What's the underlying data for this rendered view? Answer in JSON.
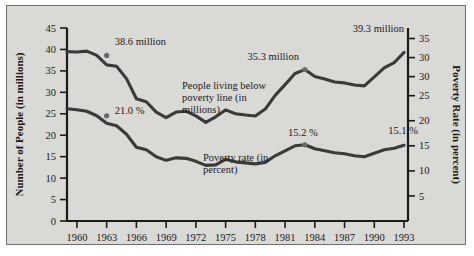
{
  "chart_data": {
    "type": "line",
    "title": "",
    "xlabel": "",
    "ylabel": "Number of People (in millions)",
    "y2label": "Poverty Rate (in percent)",
    "grid": false,
    "legend_position": "inline-annotations",
    "x": [
      1959,
      1960,
      1961,
      1962,
      1963,
      1964,
      1965,
      1966,
      1967,
      1968,
      1969,
      1970,
      1971,
      1972,
      1973,
      1974,
      1975,
      1976,
      1977,
      1978,
      1979,
      1980,
      1981,
      1982,
      1983,
      1984,
      1985,
      1986,
      1987,
      1988,
      1989,
      1990,
      1991,
      1992,
      1993
    ],
    "x_tick_labels": [
      "1960",
      "1963",
      "1966",
      "1969",
      "1972",
      "1975",
      "1978",
      "1981",
      "1984",
      "1987",
      "1990",
      "1993"
    ],
    "x_tick_values": [
      1960,
      1963,
      1966,
      1969,
      1972,
      1975,
      1978,
      1981,
      1984,
      1987,
      1990,
      1993
    ],
    "ylim": [
      0,
      45
    ],
    "y_tick_labels": [
      "0",
      "5",
      "10",
      "15",
      "20",
      "25",
      "30",
      "35",
      "40",
      "45"
    ],
    "y_tick_values": [
      0,
      5,
      10,
      15,
      20,
      25,
      30,
      35,
      40,
      45
    ],
    "y2lim": [
      0,
      38.5
    ],
    "y2_tick_labels": [
      "5",
      "10",
      "15",
      "20",
      "25",
      "30",
      "30",
      "35"
    ],
    "y2_tick_values": [
      5,
      10,
      15,
      20,
      25,
      28.8,
      32.6,
      36.4
    ],
    "series": [
      {
        "name": "People living below poverty line (in millions)",
        "axis": "left",
        "values": [
          39.5,
          39.4,
          39.6,
          38.6,
          36.4,
          36.1,
          33.2,
          28.5,
          27.8,
          25.4,
          24.1,
          25.4,
          25.6,
          24.5,
          23.0,
          24.3,
          25.9,
          25.0,
          24.7,
          24.5,
          26.1,
          29.3,
          31.8,
          34.4,
          35.3,
          33.7,
          33.1,
          32.4,
          32.2,
          31.7,
          31.5,
          33.6,
          35.7,
          36.9,
          39.3
        ]
      },
      {
        "name": "Poverty rate (in percent)",
        "axis": "right",
        "values": [
          22.4,
          22.2,
          21.9,
          21.0,
          19.5,
          19.0,
          17.3,
          14.7,
          14.2,
          12.8,
          12.1,
          12.6,
          12.5,
          11.9,
          11.1,
          11.2,
          12.3,
          11.8,
          11.6,
          11.4,
          11.7,
          13.0,
          14.0,
          15.0,
          15.2,
          14.4,
          14.0,
          13.6,
          13.4,
          13.0,
          12.8,
          13.5,
          14.2,
          14.5,
          15.1
        ]
      }
    ],
    "annotations": [
      {
        "text": "38.6 million",
        "x": 1963,
        "y": 38.6,
        "axis": "left",
        "dx": 8,
        "dy": -10,
        "anchor": "start",
        "marker": true
      },
      {
        "text": "21.0 %",
        "x": 1963,
        "y": 21.0,
        "axis": "right",
        "dx": 8,
        "dy": -2,
        "anchor": "start",
        "marker": true
      },
      {
        "text": "35.3 million",
        "x": 1983,
        "y": 35.3,
        "axis": "left",
        "dx": -6,
        "dy": -10,
        "anchor": "end",
        "marker": true
      },
      {
        "text": "39.3 million",
        "x": 1993,
        "y": 39.3,
        "axis": "left",
        "dx": 0,
        "dy": -20,
        "anchor": "end",
        "marker": false
      },
      {
        "text": "15.2 %",
        "x": 1983,
        "y": 15.2,
        "axis": "right",
        "dx": -2,
        "dy": -9,
        "anchor": "middle",
        "marker": true
      },
      {
        "text": "15.1 %",
        "x": 1991,
        "y": 15.1,
        "axis": "right",
        "dx": 4,
        "dy": -11,
        "anchor": "start",
        "marker": false
      }
    ],
    "series_labels": [
      {
        "lines": [
          "People living below",
          "poverty line (in",
          "millions)"
        ],
        "x": 175,
        "y": 83
      },
      {
        "lines": [
          "Poverty rate (in",
          "percent)",
          ""
        ],
        "x": 196,
        "y": 155
      }
    ]
  }
}
